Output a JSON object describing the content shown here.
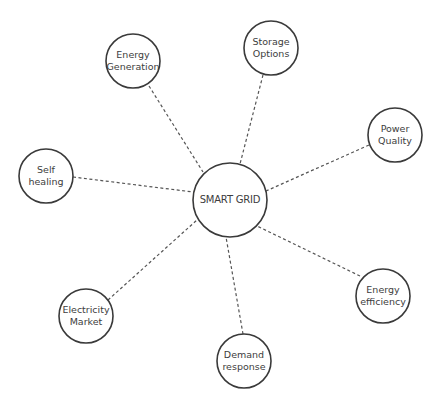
{
  "diagram": {
    "colors": {
      "stroke": "#3a3a3a",
      "connector": "#555555",
      "text": "#3d3d3d",
      "background": "#ffffff"
    },
    "center": {
      "id": "smart-grid",
      "lines": [
        "SMART GRID"
      ],
      "cx": 230,
      "cy": 200,
      "r": 37
    },
    "nodes": [
      {
        "id": "energy-generation",
        "lines": [
          "Energy",
          "Generation"
        ],
        "cx": 133,
        "cy": 61,
        "r": 27,
        "edge": [
          149,
          86,
          203,
          172
        ]
      },
      {
        "id": "storage-options",
        "lines": [
          "Storage",
          "Options"
        ],
        "cx": 271,
        "cy": 48,
        "r": 27,
        "edge": [
          263,
          75,
          240,
          164
        ]
      },
      {
        "id": "power-quality",
        "lines": [
          "Power",
          "Quality"
        ],
        "cx": 395,
        "cy": 135,
        "r": 27,
        "edge": [
          369,
          145,
          266,
          191
        ]
      },
      {
        "id": "self-healing",
        "lines": [
          "Self",
          "healing"
        ],
        "cx": 46,
        "cy": 176,
        "r": 27,
        "edge": [
          73,
          177,
          193,
          192
        ]
      },
      {
        "id": "electricity-market",
        "lines": [
          "Electricity",
          "Market"
        ],
        "cx": 86,
        "cy": 316,
        "r": 27,
        "edge": [
          108,
          300,
          197,
          220
        ]
      },
      {
        "id": "energy-efficiency",
        "lines": [
          "Energy",
          "efficiency"
        ],
        "cx": 383,
        "cy": 296,
        "r": 27,
        "edge": [
          360,
          276,
          257,
          226
        ]
      },
      {
        "id": "demand-response",
        "lines": [
          "Demand",
          "response"
        ],
        "cx": 244,
        "cy": 361,
        "r": 27,
        "edge": [
          243,
          334,
          226,
          237
        ]
      }
    ]
  }
}
